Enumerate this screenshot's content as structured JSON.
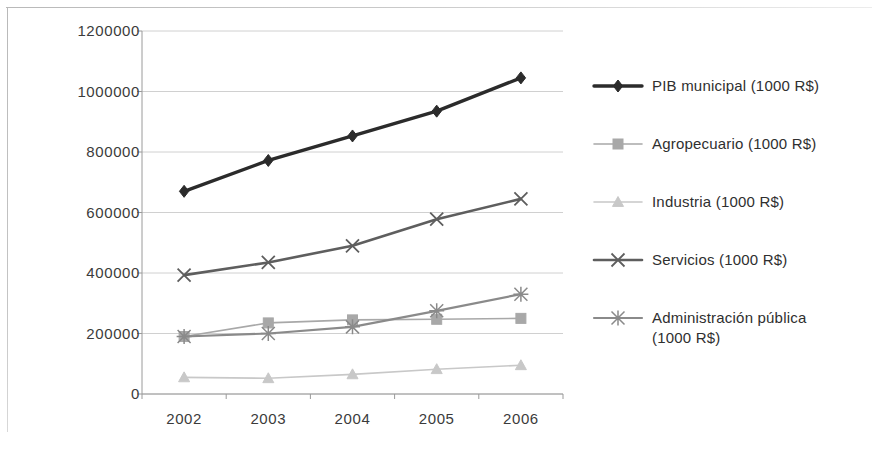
{
  "chart_data": {
    "type": "line",
    "title": "",
    "subtitle": "",
    "xlabel": "",
    "ylabel": "",
    "categories": [
      "2002",
      "2003",
      "2004",
      "2005",
      "2006"
    ],
    "x": [
      2002,
      2003,
      2004,
      2005,
      2006
    ],
    "ylim": [
      0,
      1200000
    ],
    "yticks": [
      "0",
      "200000",
      "400000",
      "600000",
      "800000",
      "1000000",
      "1200000"
    ],
    "ytick_values": [
      0,
      200000,
      400000,
      600000,
      800000,
      1000000,
      1200000
    ],
    "grid": true,
    "grid_axis": "y",
    "legend_position": "right",
    "series": [
      {
        "name": "PIB municipal (1000 R$)",
        "values": [
          670000,
          772000,
          853000,
          935000,
          1045000
        ],
        "color": "#2b2b2b",
        "marker": "diamond",
        "width": 3.4
      },
      {
        "name": "Agropecuario (1000 R$)",
        "values": [
          190000,
          235000,
          245000,
          247000,
          250000
        ],
        "color": "#a8a8a8",
        "marker": "square",
        "width": 1.6
      },
      {
        "name": "Industria (1000 R$)",
        "values": [
          55000,
          52000,
          65000,
          82000,
          95000
        ],
        "color": "#c8c8c8",
        "marker": "triangle",
        "width": 1.6
      },
      {
        "name": "Servicios (1000 R$)",
        "values": [
          393000,
          435000,
          490000,
          578000,
          645000
        ],
        "color": "#5e5e5e",
        "marker": "cross",
        "width": 2.6
      },
      {
        "name": "Administración pública\n(1000 R$)",
        "values": [
          190000,
          200000,
          222000,
          275000,
          330000
        ],
        "color": "#8a8a8a",
        "marker": "star",
        "width": 2.2
      }
    ]
  },
  "legend": {
    "items": [
      {
        "label": "PIB municipal (1000 R$)",
        "marker": "diamond-marker-icon"
      },
      {
        "label": "Agropecuario (1000 R$)",
        "marker": "square-marker-icon"
      },
      {
        "label": "Industria (1000 R$)",
        "marker": "triangle-marker-icon"
      },
      {
        "label": "Servicios (1000 R$)",
        "marker": "cross-marker-icon"
      },
      {
        "label": "Administración pública\n(1000 R$)",
        "marker": "star-marker-icon"
      }
    ]
  },
  "axis": {
    "y_labels": [
      "1200000",
      "1000000",
      "800000",
      "600000",
      "400000",
      "200000",
      "0"
    ],
    "x_labels": [
      "2002",
      "2003",
      "2004",
      "2005",
      "2006"
    ]
  },
  "colors": {
    "grid": "#d0d0d0",
    "axis": "#9a9a9a",
    "text": "#3b3b3b"
  }
}
